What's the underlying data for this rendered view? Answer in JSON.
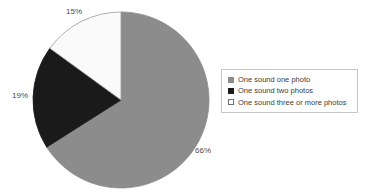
{
  "chart_data": {
    "type": "pie",
    "title": "",
    "xlabel": "",
    "ylabel": "",
    "legend_position": "right",
    "grid": false,
    "start_angle_deg": 0,
    "direction": "clockwise",
    "categories": [
      "One sound one photo",
      "One sound two photos",
      "One sound three or more photos"
    ],
    "values": [
      66,
      19,
      15
    ],
    "value_labels": [
      "66%",
      "19%",
      "15%"
    ],
    "colors": [
      "#8c8c8c",
      "#1a1a1a",
      "#fafafa"
    ],
    "slice_border_color": "#9a9a9a",
    "units": "percent"
  },
  "legend": {
    "items": [
      {
        "label": "One sound one photo",
        "marker": "filled-square-gray-icon",
        "color": "#8c8c8c"
      },
      {
        "label": "One sound two photos",
        "marker": "filled-square-black-icon",
        "color": "#1a1a1a"
      },
      {
        "label": "One sound three or more photos",
        "marker": "empty-square-white-icon",
        "color": "#ffffff"
      }
    ],
    "border_color": "#c8c8c8"
  }
}
